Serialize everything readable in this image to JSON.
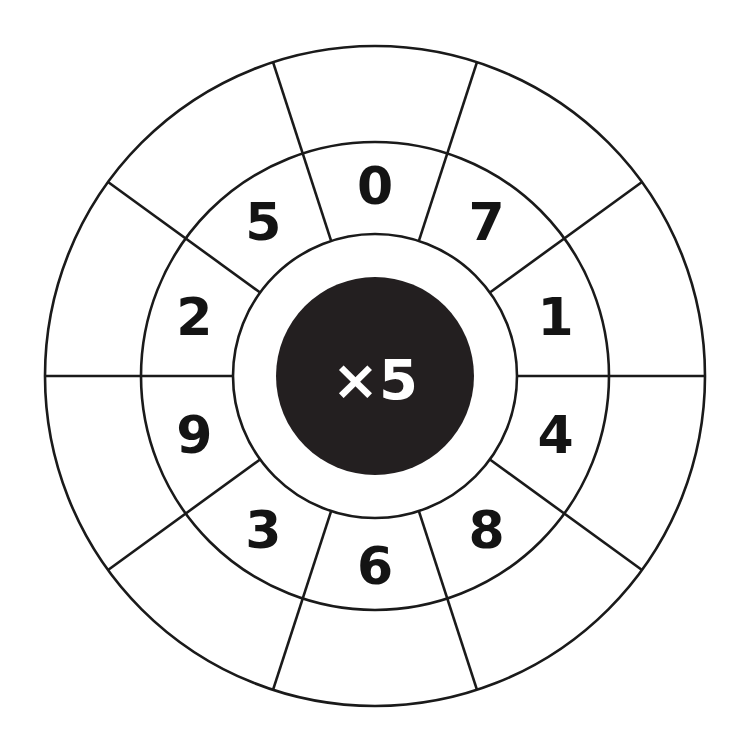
{
  "page": {
    "background_color": "#ffffff",
    "width": 746,
    "height": 753
  },
  "wheel": {
    "hub": {
      "label": "×5",
      "operator": "×",
      "multiplier": "5",
      "fill_color": "#231f20",
      "text_color": "#ffffff",
      "center_x": 375,
      "center_y": 376,
      "radius": 99
    },
    "geometry": {
      "center_x": 375,
      "center_y": 376,
      "inner_ring_radius": 142,
      "middle_ring_radius": 234,
      "outer_ring_radius": 330,
      "sector_count": 10,
      "sector_degrees": 36,
      "divider_offset_degrees": 18,
      "digit_radius": 190,
      "line_color": "#1a1a1a",
      "line_width": 2.6
    },
    "factors": [
      {
        "value": "0",
        "angle": 0
      },
      {
        "value": "7",
        "angle": 36
      },
      {
        "value": "1",
        "angle": 72
      },
      {
        "value": "4",
        "angle": 108
      },
      {
        "value": "8",
        "angle": 144
      },
      {
        "value": "6",
        "angle": 180
      },
      {
        "value": "3",
        "angle": 216
      },
      {
        "value": "9",
        "angle": 252
      },
      {
        "value": "2",
        "angle": 288
      },
      {
        "value": "5",
        "angle": 324
      }
    ],
    "answer_cells": [
      {
        "index": 0,
        "angle": 0,
        "value": ""
      },
      {
        "index": 1,
        "angle": 36,
        "value": ""
      },
      {
        "index": 2,
        "angle": 72,
        "value": ""
      },
      {
        "index": 3,
        "angle": 108,
        "value": ""
      },
      {
        "index": 4,
        "angle": 144,
        "value": ""
      },
      {
        "index": 5,
        "angle": 180,
        "value": ""
      },
      {
        "index": 6,
        "angle": 216,
        "value": ""
      },
      {
        "index": 7,
        "angle": 252,
        "value": ""
      },
      {
        "index": 8,
        "angle": 288,
        "value": ""
      },
      {
        "index": 9,
        "angle": 324,
        "value": ""
      }
    ]
  },
  "chart_data": {
    "type": "pie",
    "categories": [
      "0",
      "7",
      "1",
      "4",
      "8",
      "6",
      "3",
      "9",
      "2",
      "5"
    ],
    "values": [
      36,
      36,
      36,
      36,
      36,
      36,
      36,
      36,
      36,
      36
    ],
    "xlabel": "",
    "ylabel": "",
    "legend": "none",
    "grid": false,
    "annotations": [
      "×5"
    ]
  }
}
